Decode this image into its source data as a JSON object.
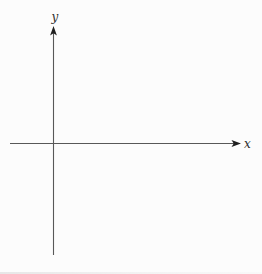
{
  "figure": {
    "x_axis_label": "x",
    "y_axis_label": "y"
  },
  "style": {
    "background": "#fcfcfc",
    "axis_color": "#585858",
    "arrow_color": "#1f1f1f",
    "label_color": "#2e2e2e"
  }
}
